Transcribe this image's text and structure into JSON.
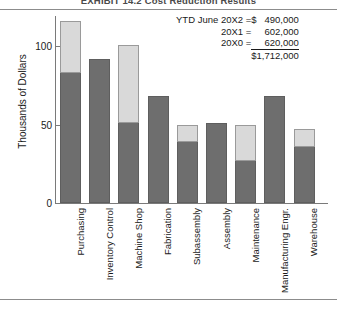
{
  "exhibit": {
    "title": "EXHIBIT 14.2   Cost Reduction Results"
  },
  "chart_data": {
    "type": "bar",
    "title": "Cost Reduction Results",
    "xlabel": "",
    "ylabel": "Thousands of Dollars",
    "ylim": [
      0,
      120
    ],
    "yticks": [
      0,
      50,
      100
    ],
    "ytick_labels": [
      "0",
      "50",
      "100"
    ],
    "grid": false,
    "legend": "none",
    "stacked": true,
    "categories": [
      "Purchasing",
      "Inventory Control",
      "Machine Shop",
      "Fabrication",
      "Subassembly",
      "Assembly",
      "Maintenance",
      "Manufacturing Engr.",
      "Warehouse"
    ],
    "series": [
      {
        "name": "Achieved",
        "color": "#6e6e6e",
        "values": [
          83,
          92,
          51,
          68,
          39,
          51,
          27,
          68,
          36
        ]
      },
      {
        "name": "Remaining",
        "color": "#d9d9d9",
        "values": [
          33,
          0,
          50,
          0,
          11,
          0,
          23,
          0,
          11
        ]
      }
    ],
    "totals": [
      116,
      92,
      101,
      68,
      50,
      51,
      50,
      68,
      47
    ]
  },
  "annotation": {
    "rows": [
      {
        "label": "YTD June 20X2 =",
        "currency": "$",
        "value": "490,000"
      },
      {
        "label": "20X1 =",
        "currency": "",
        "value": "602,000"
      },
      {
        "label": "20X0 =",
        "currency": "",
        "value": "620,000"
      }
    ],
    "total": "$1,712,000"
  },
  "axis": {
    "y_title": "Thousands of Dollars"
  }
}
